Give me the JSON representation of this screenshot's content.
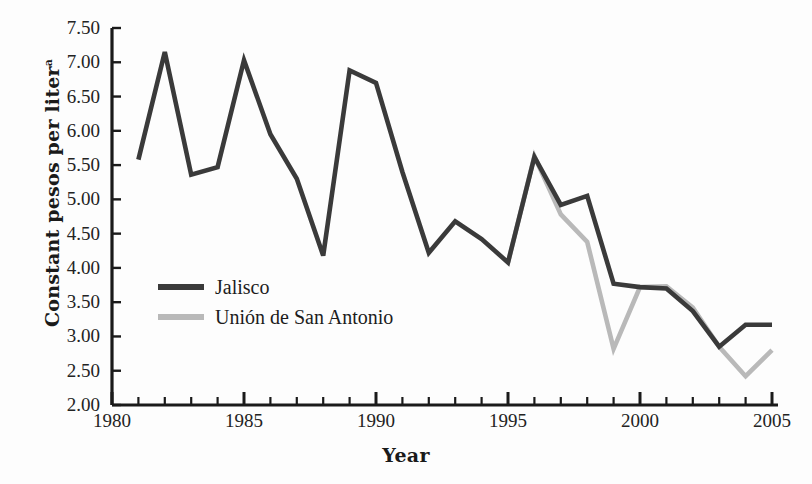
{
  "chart_data": {
    "type": "line",
    "title": "",
    "xlabel": "Year",
    "ylabel": "Constant pesos per liter",
    "ylabel_superscript": "a",
    "xlim": [
      1980,
      2005
    ],
    "ylim": [
      2.0,
      7.5
    ],
    "ytick_step": 0.5,
    "grid": false,
    "legend_position": "inside-left",
    "x_tick_labels": [
      "1980",
      "1985",
      "1990",
      "1995",
      "2000",
      "2005"
    ],
    "x_tick_values": [
      1980,
      1985,
      1990,
      1995,
      2000,
      2005
    ],
    "x_minor_ticks_every": 1,
    "y_tick_labels": [
      "7.50",
      "7.00",
      "6.50",
      "6.00",
      "5.50",
      "5.00",
      "4.50",
      "4.00",
      "3.50",
      "3.00",
      "2.50",
      "2.00"
    ],
    "y_tick_values": [
      7.5,
      7.0,
      6.5,
      6.0,
      5.5,
      5.0,
      4.5,
      4.0,
      3.5,
      3.0,
      2.5,
      2.0
    ],
    "series": [
      {
        "name": "Jalisco",
        "color": "#3a3a3a",
        "x": [
          1981,
          1982,
          1983,
          1984,
          1985,
          1986,
          1987,
          1988,
          1989,
          1990,
          1991,
          1992,
          1993,
          1994,
          1995,
          1996,
          1997,
          1998,
          1999,
          2000,
          2001,
          2002,
          2003,
          2004,
          2005
        ],
        "values": [
          5.58,
          7.15,
          5.36,
          5.47,
          7.03,
          5.95,
          5.3,
          4.18,
          6.88,
          6.7,
          5.4,
          4.22,
          4.68,
          4.42,
          4.08,
          5.62,
          4.92,
          5.05,
          3.77,
          3.72,
          3.7,
          3.37,
          2.85,
          3.17,
          3.17
        ]
      },
      {
        "name": "Unión de San Antonio",
        "color": "#b9b9b9",
        "x": [
          1995,
          1996,
          1997,
          1998,
          1999,
          2000,
          2001,
          2002,
          2003,
          2004,
          2005
        ],
        "values": [
          4.08,
          5.63,
          4.78,
          4.38,
          2.82,
          3.72,
          3.73,
          3.42,
          2.85,
          2.42,
          2.8
        ]
      }
    ]
  },
  "legend": {
    "items": [
      {
        "label": "Jalisco",
        "color": "#3a3a3a"
      },
      {
        "label": "Unión de San Antonio",
        "color": "#b9b9b9"
      }
    ]
  },
  "axis": {
    "color": "#1a1a1a"
  }
}
